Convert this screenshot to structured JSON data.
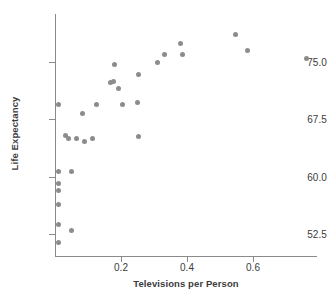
{
  "chart_data": {
    "type": "scatter",
    "title": "",
    "xlabel": "Televisions per Person",
    "ylabel": "Life Expectancy",
    "xlim": [
      -0.03,
      0.8
    ],
    "ylim": [
      50.2,
      79.5
    ],
    "grid": false,
    "legend": null,
    "xticks": [
      0.2,
      0.4,
      0.6
    ],
    "xtick_labels": [
      "0.2",
      "0.4",
      "0.6"
    ],
    "yticks": [
      52.5,
      60.0,
      67.5,
      75.0
    ],
    "ytick_labels": [
      "52.5",
      "60.0",
      "67.5",
      "75.0"
    ],
    "marker_color": "#8c8c8c",
    "axis_color": "#8a8a8a",
    "points": [
      {
        "x": 0.012,
        "y": 69.5
      },
      {
        "x": 0.082,
        "y": 68.2
      },
      {
        "x": 0.125,
        "y": 69.5
      },
      {
        "x": 0.168,
        "y": 72.3
      },
      {
        "x": 0.177,
        "y": 72.4
      },
      {
        "x": 0.18,
        "y": 74.7
      },
      {
        "x": 0.031,
        "y": 65.4
      },
      {
        "x": 0.04,
        "y": 65.0
      },
      {
        "x": 0.064,
        "y": 65.0
      },
      {
        "x": 0.088,
        "y": 64.6
      },
      {
        "x": 0.113,
        "y": 65.0
      },
      {
        "x": 0.012,
        "y": 60.7
      },
      {
        "x": 0.012,
        "y": 59.1
      },
      {
        "x": 0.012,
        "y": 58.2
      },
      {
        "x": 0.049,
        "y": 60.7
      },
      {
        "x": 0.012,
        "y": 56.3
      },
      {
        "x": 0.012,
        "y": 53.8
      },
      {
        "x": 0.049,
        "y": 53.0
      },
      {
        "x": 0.012,
        "y": 51.4
      },
      {
        "x": 0.192,
        "y": 71.5
      },
      {
        "x": 0.205,
        "y": 69.5
      },
      {
        "x": 0.251,
        "y": 69.7
      },
      {
        "x": 0.254,
        "y": 73.3
      },
      {
        "x": 0.252,
        "y": 65.3
      },
      {
        "x": 0.311,
        "y": 75.0
      },
      {
        "x": 0.333,
        "y": 76.0
      },
      {
        "x": 0.379,
        "y": 77.4
      },
      {
        "x": 0.386,
        "y": 76.0
      },
      {
        "x": 0.548,
        "y": 78.6
      },
      {
        "x": 0.584,
        "y": 76.5
      },
      {
        "x": 0.763,
        "y": 75.4
      }
    ]
  }
}
